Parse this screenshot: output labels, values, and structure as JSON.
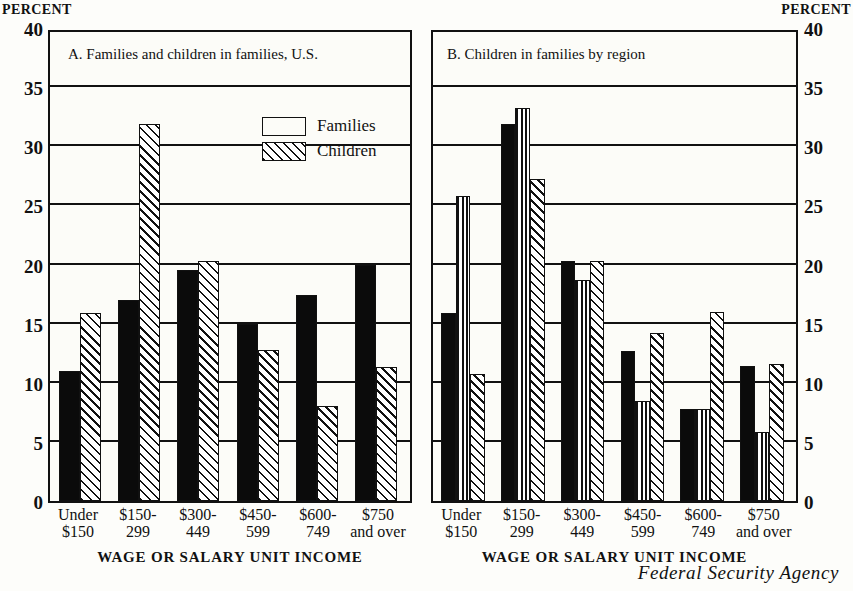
{
  "axis": {
    "percent_caption_left": "PERCENT",
    "percent_caption_right": "PERCENT",
    "x_axis_title_a": "WAGE OR SALARY UNIT INCOME",
    "x_axis_title_b": "WAGE OR SALARY UNIT INCOME"
  },
  "credit": "Federal Security Agency",
  "panels": {
    "a": {
      "title": "A. Families and children in families, U.S.",
      "legend": [
        {
          "label": "Families",
          "pattern": "solid"
        },
        {
          "label": "Children",
          "pattern": "diagonal"
        }
      ]
    },
    "b": {
      "title": "B. Children in families by region",
      "legend": [
        {
          "label": "U.S.",
          "pattern": "solid"
        },
        {
          "label": "South",
          "pattern": "vertical"
        },
        {
          "label": "West",
          "pattern": "diagonal"
        }
      ]
    }
  },
  "categories": [
    {
      "l1": "Under",
      "l2": "$150"
    },
    {
      "l1": "$150-",
      "l2": "299"
    },
    {
      "l1": "$300-",
      "l2": "449"
    },
    {
      "l1": "$450-",
      "l2": "599"
    },
    {
      "l1": "$600-",
      "l2": "749"
    },
    {
      "l1": "$750",
      "l2": "and over"
    }
  ],
  "yticks": [
    "40",
    "35",
    "30",
    "25",
    "20",
    "15",
    "10",
    "5",
    "0"
  ],
  "chart_data": [
    {
      "type": "bar",
      "title": "A. Families and children in families, U.S.",
      "xlabel": "WAGE OR SALARY UNIT INCOME",
      "ylabel": "PERCENT",
      "ylim": [
        0,
        40
      ],
      "yticks": [
        0,
        5,
        10,
        15,
        20,
        25,
        30,
        35,
        40
      ],
      "grid": true,
      "legend_position": "upper-center",
      "categories": [
        "Under $150",
        "$150-299",
        "$300-449",
        "$450-599",
        "$600-749",
        "$750 and over"
      ],
      "series": [
        {
          "name": "Families",
          "pattern": "solid",
          "values": [
            11.0,
            17.0,
            19.5,
            15.0,
            17.4,
            20.0
          ]
        },
        {
          "name": "Children",
          "pattern": "diagonal",
          "values": [
            15.9,
            31.9,
            20.3,
            12.8,
            8.0,
            11.3
          ]
        }
      ]
    },
    {
      "type": "bar",
      "title": "B. Children in families by region",
      "xlabel": "WAGE OR SALARY UNIT INCOME",
      "ylabel": "PERCENT",
      "ylim": [
        0,
        40
      ],
      "yticks": [
        0,
        5,
        10,
        15,
        20,
        25,
        30,
        35,
        40
      ],
      "grid": true,
      "legend_position": "upper-center",
      "categories": [
        "Under $150",
        "$150-299",
        "$300-449",
        "$450-599",
        "$600-749",
        "$750 and over"
      ],
      "series": [
        {
          "name": "U.S.",
          "pattern": "solid",
          "values": [
            15.9,
            31.9,
            20.3,
            12.7,
            7.8,
            11.4
          ]
        },
        {
          "name": "South",
          "pattern": "vertical",
          "values": [
            25.8,
            33.2,
            18.7,
            8.5,
            7.8,
            5.8
          ]
        },
        {
          "name": "West",
          "pattern": "diagonal",
          "values": [
            10.7,
            27.2,
            20.3,
            14.2,
            16.0,
            11.6
          ]
        }
      ]
    }
  ]
}
